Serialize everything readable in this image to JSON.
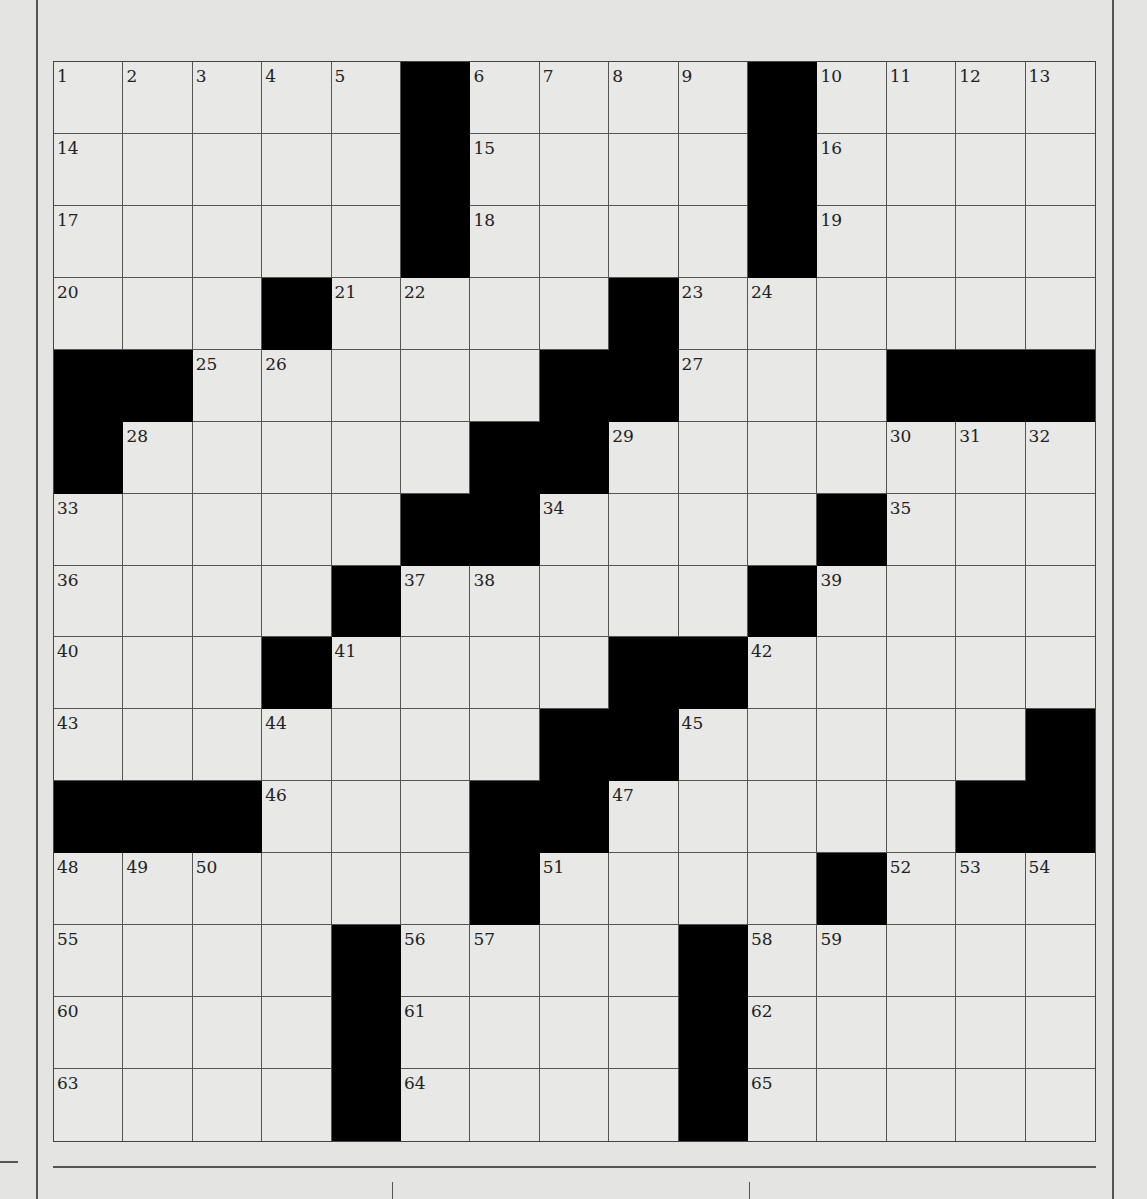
{
  "puzzle": {
    "rows": 15,
    "cols": 15,
    "black_cells": [
      [
        1,
        6
      ],
      [
        1,
        11
      ],
      [
        2,
        6
      ],
      [
        2,
        11
      ],
      [
        3,
        6
      ],
      [
        3,
        11
      ],
      [
        4,
        4
      ],
      [
        4,
        9
      ],
      [
        5,
        1
      ],
      [
        5,
        2
      ],
      [
        5,
        8
      ],
      [
        5,
        9
      ],
      [
        5,
        13
      ],
      [
        5,
        14
      ],
      [
        5,
        15
      ],
      [
        6,
        1
      ],
      [
        6,
        7
      ],
      [
        6,
        8
      ],
      [
        7,
        6
      ],
      [
        7,
        7
      ],
      [
        7,
        12
      ],
      [
        8,
        5
      ],
      [
        8,
        11
      ],
      [
        9,
        4
      ],
      [
        9,
        9
      ],
      [
        9,
        10
      ],
      [
        10,
        8
      ],
      [
        10,
        9
      ],
      [
        10,
        15
      ],
      [
        11,
        1
      ],
      [
        11,
        2
      ],
      [
        11,
        3
      ],
      [
        11,
        7
      ],
      [
        11,
        8
      ],
      [
        11,
        14
      ],
      [
        11,
        15
      ],
      [
        12,
        7
      ],
      [
        12,
        12
      ],
      [
        13,
        5
      ],
      [
        13,
        10
      ],
      [
        14,
        5
      ],
      [
        14,
        10
      ],
      [
        15,
        5
      ],
      [
        15,
        10
      ]
    ],
    "numbers": [
      {
        "r": 1,
        "c": 1,
        "n": "1"
      },
      {
        "r": 1,
        "c": 2,
        "n": "2"
      },
      {
        "r": 1,
        "c": 3,
        "n": "3"
      },
      {
        "r": 1,
        "c": 4,
        "n": "4"
      },
      {
        "r": 1,
        "c": 5,
        "n": "5"
      },
      {
        "r": 1,
        "c": 7,
        "n": "6"
      },
      {
        "r": 1,
        "c": 8,
        "n": "7"
      },
      {
        "r": 1,
        "c": 9,
        "n": "8"
      },
      {
        "r": 1,
        "c": 10,
        "n": "9"
      },
      {
        "r": 1,
        "c": 12,
        "n": "10"
      },
      {
        "r": 1,
        "c": 13,
        "n": "11"
      },
      {
        "r": 1,
        "c": 14,
        "n": "12"
      },
      {
        "r": 1,
        "c": 15,
        "n": "13"
      },
      {
        "r": 2,
        "c": 1,
        "n": "14"
      },
      {
        "r": 2,
        "c": 7,
        "n": "15"
      },
      {
        "r": 2,
        "c": 12,
        "n": "16"
      },
      {
        "r": 3,
        "c": 1,
        "n": "17"
      },
      {
        "r": 3,
        "c": 7,
        "n": "18"
      },
      {
        "r": 3,
        "c": 12,
        "n": "19"
      },
      {
        "r": 4,
        "c": 1,
        "n": "20"
      },
      {
        "r": 4,
        "c": 5,
        "n": "21"
      },
      {
        "r": 4,
        "c": 6,
        "n": "22"
      },
      {
        "r": 4,
        "c": 10,
        "n": "23"
      },
      {
        "r": 4,
        "c": 11,
        "n": "24"
      },
      {
        "r": 5,
        "c": 3,
        "n": "25"
      },
      {
        "r": 5,
        "c": 4,
        "n": "26"
      },
      {
        "r": 5,
        "c": 10,
        "n": "27"
      },
      {
        "r": 6,
        "c": 2,
        "n": "28"
      },
      {
        "r": 6,
        "c": 9,
        "n": "29"
      },
      {
        "r": 6,
        "c": 13,
        "n": "30"
      },
      {
        "r": 6,
        "c": 14,
        "n": "31"
      },
      {
        "r": 6,
        "c": 15,
        "n": "32"
      },
      {
        "r": 7,
        "c": 1,
        "n": "33"
      },
      {
        "r": 7,
        "c": 8,
        "n": "34"
      },
      {
        "r": 7,
        "c": 13,
        "n": "35"
      },
      {
        "r": 8,
        "c": 1,
        "n": "36"
      },
      {
        "r": 8,
        "c": 6,
        "n": "37"
      },
      {
        "r": 8,
        "c": 7,
        "n": "38"
      },
      {
        "r": 8,
        "c": 12,
        "n": "39"
      },
      {
        "r": 9,
        "c": 1,
        "n": "40"
      },
      {
        "r": 9,
        "c": 5,
        "n": "41"
      },
      {
        "r": 9,
        "c": 11,
        "n": "42"
      },
      {
        "r": 10,
        "c": 1,
        "n": "43"
      },
      {
        "r": 10,
        "c": 4,
        "n": "44"
      },
      {
        "r": 10,
        "c": 10,
        "n": "45"
      },
      {
        "r": 11,
        "c": 4,
        "n": "46"
      },
      {
        "r": 11,
        "c": 9,
        "n": "47"
      },
      {
        "r": 12,
        "c": 1,
        "n": "48"
      },
      {
        "r": 12,
        "c": 2,
        "n": "49"
      },
      {
        "r": 12,
        "c": 3,
        "n": "50"
      },
      {
        "r": 12,
        "c": 8,
        "n": "51"
      },
      {
        "r": 12,
        "c": 13,
        "n": "52"
      },
      {
        "r": 12,
        "c": 14,
        "n": "53"
      },
      {
        "r": 12,
        "c": 15,
        "n": "54"
      },
      {
        "r": 13,
        "c": 1,
        "n": "55"
      },
      {
        "r": 13,
        "c": 6,
        "n": "56"
      },
      {
        "r": 13,
        "c": 7,
        "n": "57"
      },
      {
        "r": 13,
        "c": 11,
        "n": "58"
      },
      {
        "r": 13,
        "c": 12,
        "n": "59"
      },
      {
        "r": 14,
        "c": 1,
        "n": "60"
      },
      {
        "r": 14,
        "c": 6,
        "n": "61"
      },
      {
        "r": 14,
        "c": 11,
        "n": "62"
      },
      {
        "r": 15,
        "c": 1,
        "n": "63"
      },
      {
        "r": 15,
        "c": 6,
        "n": "64"
      },
      {
        "r": 15,
        "c": 11,
        "n": "65"
      }
    ],
    "colors": {
      "paper": "#e8e8e6",
      "black_square": "#000000",
      "grid_line": "#555555"
    }
  }
}
